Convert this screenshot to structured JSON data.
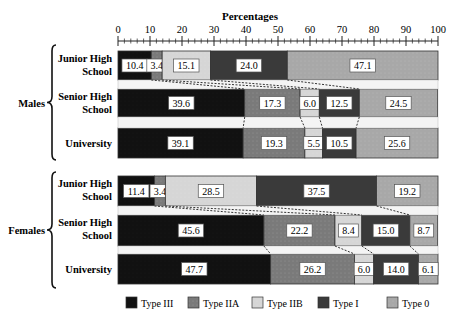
{
  "chart_data": {
    "type": "bar",
    "orientation": "horizontal-stacked-100",
    "title": "Percentages",
    "xlabel": "Percentages",
    "ylabel": "",
    "xlim": [
      0,
      100
    ],
    "xticks": [
      0,
      10,
      20,
      30,
      40,
      50,
      60,
      70,
      80,
      90,
      100
    ],
    "legend_position": "bottom",
    "groups": [
      {
        "name": "Males",
        "categories": [
          "Junior High School",
          "Senior High School",
          "University"
        ],
        "series": [
          {
            "name": "Type III",
            "values": [
              10.4,
              39.6,
              39.1
            ]
          },
          {
            "name": "Type IIA",
            "values": [
              3.4,
              17.3,
              19.3
            ]
          },
          {
            "name": "Type IIB",
            "values": [
              15.1,
              6.0,
              5.5
            ]
          },
          {
            "name": "Type I",
            "values": [
              24.0,
              12.5,
              10.5
            ]
          },
          {
            "name": "Type 0",
            "values": [
              47.1,
              24.5,
              25.6
            ]
          }
        ]
      },
      {
        "name": "Females",
        "categories": [
          "Junior High School",
          "Senior High School",
          "University"
        ],
        "series": [
          {
            "name": "Type III",
            "values": [
              11.4,
              45.6,
              47.7
            ]
          },
          {
            "name": "Type IIA",
            "values": [
              3.4,
              22.2,
              26.2
            ]
          },
          {
            "name": "Type IIB",
            "values": [
              28.5,
              8.4,
              6.0
            ]
          },
          {
            "name": "Type I",
            "values": [
              37.5,
              15.0,
              14.0
            ]
          },
          {
            "name": "Type 0",
            "values": [
              19.2,
              8.7,
              6.1
            ]
          }
        ]
      }
    ]
  },
  "legend": [
    {
      "name": "Type III",
      "color": "#111111"
    },
    {
      "name": "Type IIA",
      "color": "#7a7a7a"
    },
    {
      "name": "Type IIB",
      "color": "#d6d6d6"
    },
    {
      "name": "Type I",
      "color": "#3a3a3a"
    },
    {
      "name": "Type 0",
      "color": "#a8a8a8"
    }
  ],
  "row_labels": [
    {
      "line1": "Junior High",
      "line2": "School"
    },
    {
      "line1": "Senior High",
      "line2": "School"
    },
    {
      "line1": "University",
      "line2": ""
    }
  ]
}
